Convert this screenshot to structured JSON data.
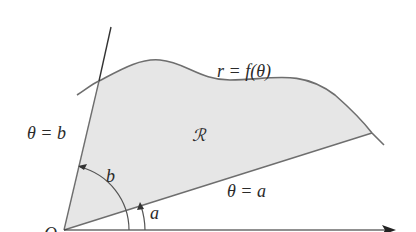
{
  "diagram": {
    "type": "polar-region",
    "labels": {
      "curve": "r = f(θ)",
      "ray_b": "θ = b",
      "ray_a": "θ = a",
      "region": "ℛ",
      "angle_b": "b",
      "angle_a": "a",
      "origin": "O"
    },
    "colors": {
      "region_fill": "#e6e6e6",
      "stroke": "#6e6e6e",
      "axis": "#222222"
    }
  }
}
